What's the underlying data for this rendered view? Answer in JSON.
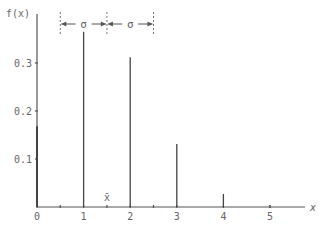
{
  "chart_data": {
    "type": "bar",
    "subtype": "probability-mass-spikes",
    "title": "",
    "xlabel": "x",
    "ylabel": "f(x)",
    "categories": [
      0,
      1,
      2,
      3,
      4,
      5
    ],
    "values": [
      0.168,
      0.365,
      0.312,
      0.131,
      0.027,
      0.0
    ],
    "xlim": [
      0,
      5.7
    ],
    "ylim": [
      0,
      0.37
    ],
    "x_ticks": [
      "0",
      "1",
      "2",
      "3",
      "4",
      "5"
    ],
    "x_minor_ticks": [
      0.5,
      1.5,
      2.5,
      5.0
    ],
    "y_ticks": [
      "0.1",
      "0.2",
      "0.3"
    ],
    "grid": false,
    "annotations": {
      "mean_label": "x̄",
      "mean_x": 1.5,
      "sigma_label": "σ",
      "sigma_intervals": [
        [
          0.5,
          1.5
        ],
        [
          1.5,
          2.5
        ]
      ]
    }
  }
}
